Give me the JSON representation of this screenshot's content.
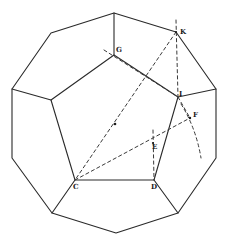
{
  "figure": {
    "labels": {
      "G": "G",
      "K": "K",
      "I": "I",
      "F": "F",
      "E": "E",
      "C": "C",
      "D": "D"
    },
    "colors": {
      "line": "#2a2a2a",
      "dashed": "#3a3a3a",
      "background": "#ffffff"
    }
  }
}
